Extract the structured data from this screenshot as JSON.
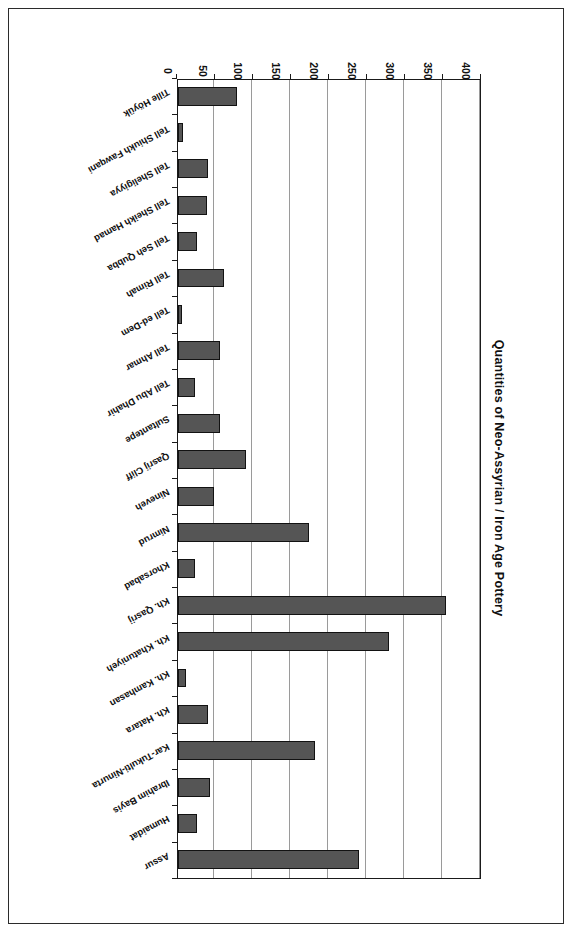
{
  "chart": {
    "title": "Quantities of Neo-Assyrian / Iron Age Pottery",
    "value_axis_title": "Number of vessels / types"
  },
  "chart_data": {
    "type": "bar",
    "orientation": "horizontal",
    "title": "Quantities of Neo-Assyrian / Iron Age Pottery",
    "xlabel": "Number of vessels / types",
    "ylabel": "",
    "xlim": [
      0,
      400
    ],
    "grid": true,
    "legend": false,
    "tick_labels": [
      "0",
      "50",
      "100",
      "150",
      "200",
      "250",
      "300",
      "350",
      "400"
    ],
    "ticks": [
      0,
      50,
      100,
      150,
      200,
      250,
      300,
      350,
      400
    ],
    "categories": [
      "Assur",
      "Humaidat",
      "Ibrahim Bayis",
      "Kar-Tukulti-Ninurta",
      "Kh. Hatara",
      "Kh. Kamhasan",
      "Kh. Khatuniyeh",
      "Kh. Qasrij",
      "Khorsabad",
      "Nimrud",
      "Nineveh",
      "Qasrij Cliff",
      "Sultantepe",
      "Tell Abu Dhahir",
      "Tell Ahmar",
      "Tell ed-Dem",
      "Tell Rimah",
      "Tell Seh Qubba",
      "Tell Sheikh Hamad",
      "Tell Sheligiyya",
      "Tell Shiukh Fawqani",
      "Tille Höyük"
    ],
    "values": [
      238,
      25,
      42,
      180,
      40,
      10,
      278,
      352,
      22,
      172,
      48,
      90,
      55,
      22,
      55,
      5,
      60,
      25,
      38,
      40,
      7,
      78
    ],
    "colors": {
      "bar_fill": "#555555",
      "bar_edge": "#121212",
      "gridline": "#9a9a9a",
      "axis": "#1a1a1a",
      "background": "#ffffff"
    }
  }
}
